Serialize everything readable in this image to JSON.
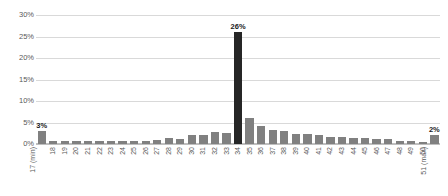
{
  "chart_data": {
    "type": "bar",
    "title": "",
    "subtitle": "",
    "xlabel": "",
    "ylabel": "",
    "ylim": [
      0,
      30
    ],
    "yticks": [
      "0%",
      "5%",
      "10%",
      "15%",
      "20%",
      "25%",
      "30%"
    ],
    "ytick_values": [
      0,
      5,
      10,
      15,
      20,
      25,
      30
    ],
    "grid": true,
    "legend": false,
    "categories": [
      "17 (min)",
      "18",
      "19",
      "20",
      "21",
      "22",
      "23",
      "24",
      "25",
      "26",
      "27",
      "28",
      "29",
      "30",
      "31",
      "32",
      "33",
      "34",
      "35",
      "36",
      "37",
      "38",
      "39",
      "40",
      "41",
      "42",
      "43",
      "44",
      "45",
      "46",
      "47",
      "48",
      "49",
      "50",
      "51 (max)"
    ],
    "values": [
      3.0,
      0.8,
      0.8,
      0.8,
      0.8,
      0.8,
      0.8,
      0.8,
      0.8,
      0.8,
      1.0,
      1.4,
      1.2,
      2.1,
      2.1,
      2.7,
      2.6,
      26.0,
      6.0,
      4.3,
      3.2,
      3.0,
      2.4,
      2.4,
      2.0,
      1.6,
      1.6,
      1.4,
      1.4,
      1.2,
      1.1,
      0.8,
      0.8,
      0.4,
      2.0
    ],
    "highlight_index": 17,
    "bar_labels": [
      {
        "index": 0,
        "text": "3%"
      },
      {
        "index": 17,
        "text": "26%"
      },
      {
        "index": 34,
        "text": "2%"
      }
    ],
    "colors": {
      "bar": "#808080",
      "bar_highlight": "#262626",
      "gridline": "#d9d9d9",
      "axis": "#bfbfbf",
      "tick_text": "#595959",
      "label_text": "#1a1a1a",
      "background": "#ffffff"
    }
  }
}
